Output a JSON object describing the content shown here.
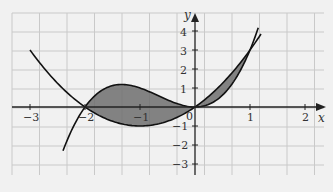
{
  "chart_data": {
    "type": "line",
    "title": "",
    "xlabel": "x",
    "ylabel": "y",
    "xlim": [
      -3.35,
      2.3
    ],
    "ylim": [
      -3.6,
      4.5
    ],
    "grid": true,
    "x_ticks": [
      "-3",
      "-2",
      "-1",
      "0",
      "1",
      "2"
    ],
    "y_ticks": [
      "4",
      "3",
      "2",
      "1",
      "-1",
      "-2",
      "-3"
    ],
    "series": [
      {
        "name": "y = x^3 + 2x^2 (cubic)",
        "x_range": [
          -2.4,
          1.15
        ],
        "points": [
          [
            -2.4,
            -2.3
          ],
          [
            -2,
            0
          ],
          [
            -1.333,
            1.19
          ],
          [
            -1,
            1
          ],
          [
            0,
            0
          ],
          [
            1,
            3
          ],
          [
            1.15,
            4.17
          ]
        ]
      },
      {
        "name": "y = x^2 + 2x (parabola)",
        "x_range": [
          -3,
          1.2
        ],
        "points": [
          [
            -3,
            3
          ],
          [
            -2,
            0
          ],
          [
            -1,
            -1
          ],
          [
            0,
            0
          ],
          [
            1,
            3
          ],
          [
            1.2,
            3.84
          ]
        ]
      }
    ],
    "shaded_regions": [
      {
        "between": "cubic and parabola",
        "x_from": -2,
        "x_to": 0
      },
      {
        "between": "cubic and parabola",
        "x_from": 0,
        "x_to": 1
      }
    ],
    "intersections": [
      [
        -2,
        0
      ],
      [
        0,
        0
      ],
      [
        1,
        3
      ]
    ]
  },
  "labels": {
    "x_axis": "x",
    "y_axis": "y",
    "origin": "0",
    "xt": {
      "m3": "−3",
      "m2": "−2",
      "m1": "−1",
      "p1": "1",
      "p2": "2"
    },
    "yt": {
      "p4": "4",
      "p3": "3",
      "p2": "2",
      "p1": "1",
      "m1": "−1",
      "m2": "−2",
      "m3": "−3"
    }
  },
  "colors": {
    "shade": "#6e6e6e",
    "curve": "#111111",
    "grid": "#c9c9c9"
  }
}
